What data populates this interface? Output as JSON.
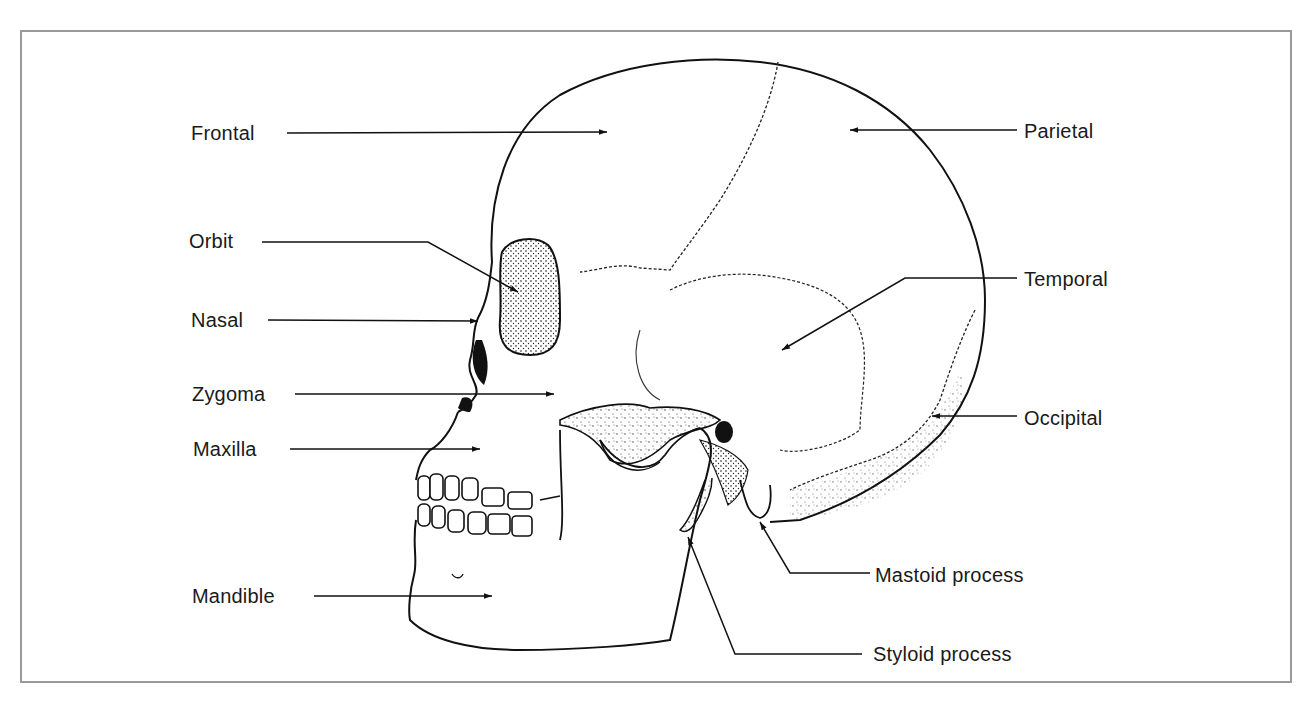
{
  "figure": {
    "frame_color": "#9a9a9a",
    "line_color": "#111111"
  },
  "labels": {
    "frontal": "Frontal",
    "parietal": "Parietal",
    "orbit": "Orbit",
    "nasal": "Nasal",
    "temporal": "Temporal",
    "zygoma": "Zygoma",
    "occipital": "Occipital",
    "maxilla": "Maxilla",
    "mandible": "Mandible",
    "mastoid": "Mastoid process",
    "styloid": "Styloid process"
  }
}
